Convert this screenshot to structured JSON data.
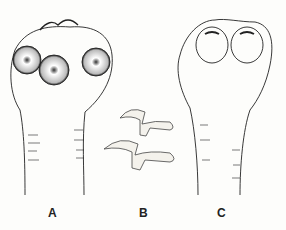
{
  "figure": {
    "panels": [
      {
        "id": "A",
        "label": "A",
        "description": "scolex with four suckers and rostellum with hooks"
      },
      {
        "id": "B",
        "label": "B",
        "description": "two rostellar hooks"
      },
      {
        "id": "C",
        "label": "C",
        "description": "scolex with two bothria, no hooks"
      }
    ]
  }
}
